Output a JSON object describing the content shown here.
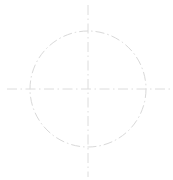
{
  "canvas": {
    "width": 173,
    "height": 180,
    "background_color": "#ffffff",
    "title": "Center-line circle with crosshair axes"
  },
  "style": {
    "line_color": "#dadada",
    "circle_color": "#d9d9d9",
    "axis_color": "#dcdcdc",
    "line_width": 1,
    "dash_pattern": "dash-dot",
    "dash_array_circle": "9 3 1.5 3",
    "dash_array_axis": "10 3.5 1.5 3.5"
  },
  "figure": {
    "center": {
      "x": 88,
      "y": 89
    },
    "circle": {
      "label": "center-line circle",
      "radius": 58,
      "left": 30,
      "right": 146,
      "top": 31,
      "bottom": 147
    },
    "horizontal_axis": {
      "label": "horizontal center line",
      "x_start": 7,
      "x_end": 173,
      "y": 89
    },
    "vertical_axis": {
      "label": "vertical center line",
      "y_start": 5,
      "y_end": 177,
      "x": 88
    }
  },
  "chart_data": {
    "type": "scatter",
    "xlabel": "",
    "ylabel": "",
    "xlim": [
      0,
      173
    ],
    "ylim": [
      0,
      180
    ],
    "grid": false,
    "legend": "none",
    "series": [
      {
        "name": "circle",
        "shape": "circle",
        "center_x": 88,
        "center_y": 89,
        "radius": 58,
        "linestyle": "dashdot",
        "color": "#d9d9d9"
      },
      {
        "name": "horizontal-center-line",
        "shape": "line",
        "x": [
          7,
          173
        ],
        "y": [
          89,
          89
        ],
        "linestyle": "dashdot",
        "color": "#dcdcdc"
      },
      {
        "name": "vertical-center-line",
        "shape": "line",
        "x": [
          88,
          88
        ],
        "y": [
          5,
          177
        ],
        "linestyle": "dashdot",
        "color": "#dcdcdc"
      }
    ]
  }
}
